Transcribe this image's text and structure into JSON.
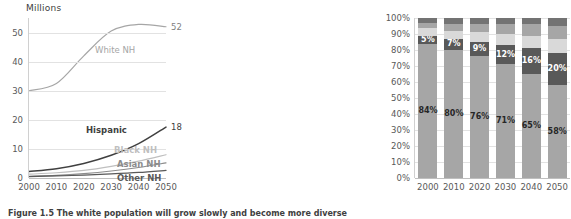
{
  "figure": {
    "caption": "Figure 1.5 The white population will grow slowly and become more diverse"
  },
  "chart_data": [
    {
      "id": "line-chart",
      "type": "line",
      "title": "Millions",
      "xlabel": "",
      "ylabel": "Millions",
      "x": [
        2000,
        2010,
        2020,
        2030,
        2040,
        2050
      ],
      "xtick_labels": [
        "2000",
        "2010",
        "2020",
        "2030",
        "2040",
        "2050"
      ],
      "ylim": [
        0,
        55
      ],
      "yticks": [
        0,
        10,
        20,
        30,
        40,
        50
      ],
      "ytick_labels": [
        "0",
        "10",
        "20",
        "30",
        "40",
        "50"
      ],
      "grid": true,
      "legend": "inline-labels",
      "series": [
        {
          "name": "White NH",
          "label": "White NH",
          "color": "#a6a6a6",
          "end_label": "52",
          "values": [
            30,
            32.5,
            42,
            50.5,
            52.8,
            52
          ]
        },
        {
          "name": "Hispanic",
          "label": "Hispanic",
          "color": "#404040",
          "end_label": "18",
          "values": [
            2.2,
            3.2,
            5.0,
            7.8,
            11.8,
            17.5
          ]
        },
        {
          "name": "Black NH",
          "label": "Black NH",
          "color": "#bfbfbf",
          "end_label": "",
          "values": [
            1.3,
            1.8,
            2.6,
            4.0,
            5.8,
            8.0
          ]
        },
        {
          "name": "Asian NH",
          "label": "Asian NH",
          "color": "#8c8c8c",
          "end_label": "",
          "values": [
            0.6,
            0.9,
            1.5,
            2.4,
            3.6,
            5.2
          ]
        },
        {
          "name": "Other NH",
          "label": "Other NH",
          "color": "#595959",
          "end_label": "",
          "values": [
            0.5,
            0.7,
            1.0,
            1.4,
            1.9,
            2.6
          ]
        }
      ]
    },
    {
      "id": "stacked-bar-chart",
      "type": "bar",
      "stacked": true,
      "title": "",
      "xlabel": "",
      "ylabel": "",
      "categories": [
        "2000",
        "2010",
        "2020",
        "2030",
        "2040",
        "2050"
      ],
      "ylim": [
        0,
        100
      ],
      "yticks": [
        0,
        10,
        20,
        30,
        40,
        50,
        60,
        70,
        80,
        90,
        100
      ],
      "ytick_labels": [
        "0%",
        "10%",
        "20%",
        "30%",
        "40%",
        "50%",
        "60%",
        "70%",
        "80%",
        "90%",
        "100%"
      ],
      "grid": true,
      "series": [
        {
          "name": "White NH",
          "color": "#a6a6a6",
          "label_color": "on-light",
          "values": [
            84,
            80,
            76,
            71,
            65,
            58
          ],
          "labels": [
            "84%",
            "80%",
            "76%",
            "71%",
            "65%",
            "58%"
          ]
        },
        {
          "name": "Hispanic",
          "color": "#595959",
          "label_color": "on-dark",
          "values": [
            5,
            7,
            9,
            12,
            16,
            20
          ],
          "labels": [
            "5%",
            "7%",
            "9%",
            "12%",
            "16%",
            "20%"
          ]
        },
        {
          "name": "Black NH",
          "color": "#d9d9d9",
          "label_color": "on-light",
          "values": [
            5,
            5,
            6,
            7,
            8,
            9
          ],
          "labels": [
            "",
            "",
            "",
            "",
            "",
            ""
          ]
        },
        {
          "name": "Asian NH",
          "color": "#a6a6a6",
          "label_color": "on-light",
          "values": [
            3,
            4,
            5,
            6,
            7,
            8
          ],
          "labels": [
            "",
            "",
            "",
            "",
            "",
            ""
          ]
        },
        {
          "name": "Other NH",
          "color": "#737373",
          "label_color": "on-dark",
          "values": [
            3,
            4,
            4,
            4,
            4,
            5
          ],
          "labels": [
            "",
            "",
            "",
            "",
            "",
            ""
          ]
        }
      ]
    }
  ]
}
